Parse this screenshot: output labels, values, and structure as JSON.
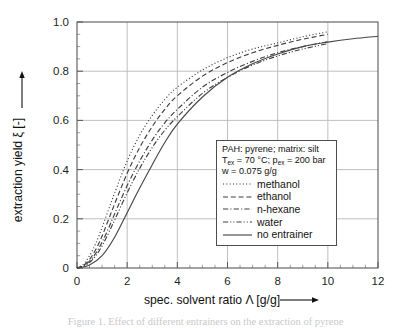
{
  "chart_data": {
    "type": "line",
    "title": "",
    "xlabel": "spec. solvent ratio Λ [g/g]",
    "ylabel": "extraction yield ξ [-]",
    "xlim": [
      0,
      12
    ],
    "ylim": [
      0,
      1.0
    ],
    "grid": true,
    "legend_position": "center-right",
    "x_ticks": [
      "0",
      "2",
      "4",
      "6",
      "8",
      "10",
      "12"
    ],
    "x_tick_values": [
      0,
      2,
      4,
      6,
      8,
      10,
      12
    ],
    "y_ticks": [
      "0",
      "0.2",
      "0.4",
      "0.6",
      "0.8",
      "1.0"
    ],
    "y_tick_values": [
      0,
      0.2,
      0.4,
      0.6,
      0.8,
      1.0
    ],
    "x_minor_step": 0.5,
    "y_minor_step": 0.05,
    "series": [
      {
        "name": "methanol",
        "style": "dotted",
        "x": [
          0,
          0.25,
          0.5,
          0.75,
          1,
          1.25,
          1.5,
          2,
          2.5,
          3,
          3.5,
          4,
          5,
          6,
          7,
          8,
          9,
          10
        ],
        "values": [
          0,
          0.015,
          0.05,
          0.1,
          0.165,
          0.235,
          0.305,
          0.435,
          0.54,
          0.62,
          0.685,
          0.735,
          0.805,
          0.855,
          0.89,
          0.915,
          0.94,
          0.96
        ]
      },
      {
        "name": "ethanol",
        "style": "dashed",
        "x": [
          0,
          0.25,
          0.5,
          0.75,
          1,
          1.25,
          1.5,
          2,
          2.5,
          3,
          3.5,
          4,
          5,
          6,
          7,
          8,
          9,
          10
        ],
        "values": [
          0,
          0.01,
          0.035,
          0.075,
          0.13,
          0.195,
          0.26,
          0.385,
          0.49,
          0.575,
          0.645,
          0.7,
          0.78,
          0.835,
          0.875,
          0.905,
          0.93,
          0.95
        ]
      },
      {
        "name": "n-hexane",
        "style": "dashdot",
        "x": [
          0,
          0.25,
          0.5,
          0.75,
          1,
          1.25,
          1.5,
          2,
          2.5,
          3,
          3.5,
          4,
          5,
          6,
          7,
          8,
          9,
          10
        ],
        "values": [
          0,
          0.008,
          0.028,
          0.06,
          0.105,
          0.16,
          0.22,
          0.335,
          0.435,
          0.52,
          0.59,
          0.645,
          0.735,
          0.795,
          0.84,
          0.875,
          0.9,
          0.92
        ]
      },
      {
        "name": "water",
        "style": "dashdotdot",
        "x": [
          0,
          0.25,
          0.5,
          0.75,
          1,
          1.25,
          1.5,
          2,
          2.5,
          3,
          3.5,
          4,
          5,
          6,
          7,
          8,
          9,
          10
        ],
        "values": [
          0,
          0.006,
          0.022,
          0.05,
          0.09,
          0.14,
          0.195,
          0.305,
          0.405,
          0.49,
          0.56,
          0.615,
          0.71,
          0.775,
          0.825,
          0.862,
          0.89,
          0.912
        ]
      },
      {
        "name": "no entrainer",
        "style": "solid",
        "x": [
          0,
          0.5,
          1,
          1.5,
          2,
          2.5,
          3,
          3.5,
          4,
          5,
          6,
          7,
          8,
          9,
          10,
          11,
          12
        ],
        "values": [
          0,
          0.012,
          0.05,
          0.125,
          0.225,
          0.325,
          0.42,
          0.51,
          0.585,
          0.695,
          0.775,
          0.83,
          0.87,
          0.9,
          0.918,
          0.932,
          0.942
        ]
      }
    ]
  },
  "axes": {
    "y_label": "extraction yield ξ [-]",
    "x_label": "spec. solvent ratio Λ [g/g]",
    "x_tick_labels": [
      "0",
      "2",
      "4",
      "6",
      "8",
      "10",
      "12"
    ],
    "y_tick_labels": [
      "1.0",
      "0.8",
      "0.6",
      "0.4",
      "0.2",
      "0"
    ]
  },
  "legend": {
    "header_line1": "PAH: pyrene; matrix: silt",
    "header_line2_pre": "T",
    "header_line2_sub1": "ex",
    "header_line2_mid": " = 70 °C; p",
    "header_line2_sub2": "ex",
    "header_line2_post": " = 200 bar",
    "header_line3": "w = 0.075 g/g",
    "entries": [
      {
        "label": "methanol",
        "style": "dotted"
      },
      {
        "label": "ethanol",
        "style": "dashed"
      },
      {
        "label": "n-hexane",
        "style": "dashdot"
      },
      {
        "label": "water",
        "style": "dashdotdot"
      },
      {
        "label": "no entrainer",
        "style": "solid"
      }
    ]
  },
  "caption": {
    "text": "Figure 1. Effect of different entrainers on the extraction of pyrene"
  }
}
